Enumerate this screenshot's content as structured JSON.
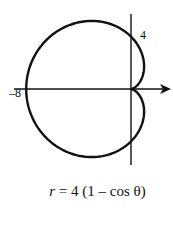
{
  "figure": {
    "type": "polar-curve",
    "equation_var": "r",
    "equation_rhs": "= 4 (1 – cos θ)",
    "labels": {
      "x_intercept": "–8",
      "y_intercept": "4"
    },
    "curve": {
      "name": "cardioid",
      "a": 4,
      "form": "r = a(1 - cosθ)"
    },
    "colors": {
      "stroke": "#111111",
      "background": "#ffffff"
    }
  }
}
